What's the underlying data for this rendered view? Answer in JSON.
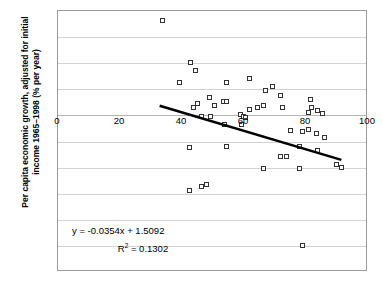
{
  "chart_data": {
    "type": "scatter",
    "title": "",
    "xlabel": "",
    "ylabel": "Per capita economic growth, adjusted for initial income 1965–1998 (% per year)",
    "ylabel_line1": "Per capita economic growth, adjusted for initial",
    "ylabel_line2": "income 1965–1998 (% per year)",
    "xlim": [
      0,
      100
    ],
    "ylim": [
      -6,
      4
    ],
    "xticks": [
      0,
      20,
      40,
      60,
      80,
      100
    ],
    "yticks": [
      4,
      3,
      2,
      1,
      0,
      -1,
      -2,
      -3,
      -4,
      -5,
      -6
    ],
    "xtick_labels": [
      "0",
      "20",
      "40",
      "60",
      "80",
      "100"
    ],
    "ytick_labels": [
      "4",
      "3",
      "2",
      "1",
      "0",
      "-1",
      "-2",
      "-3",
      "-4",
      "-5",
      "-6"
    ],
    "grid": "horizontal",
    "legend": "none",
    "marker": "open-square",
    "marker_color": "#333333",
    "trendline": {
      "equation": "y = -0.0354x + 1.5092",
      "r2_label": "R",
      "r2_exponent": "2",
      "r2_value": "= 0.1302",
      "slope": -0.0354,
      "intercept": 1.5092,
      "r_squared": 0.1302,
      "x_start": 33,
      "x_end": 92,
      "color": "#000000"
    },
    "points": [
      [
        34.0,
        3.6
      ],
      [
        43.0,
        2.0
      ],
      [
        44.5,
        1.7
      ],
      [
        39.5,
        1.25
      ],
      [
        54.5,
        1.25
      ],
      [
        62.0,
        1.4
      ],
      [
        67.0,
        0.95
      ],
      [
        69.5,
        1.1
      ],
      [
        72.0,
        0.75
      ],
      [
        49.0,
        0.65
      ],
      [
        45.0,
        0.45
      ],
      [
        53.5,
        0.5
      ],
      [
        54.5,
        0.5
      ],
      [
        50.5,
        0.35
      ],
      [
        44.0,
        0.3
      ],
      [
        64.5,
        0.3
      ],
      [
        66.5,
        0.35
      ],
      [
        62.0,
        0.2
      ],
      [
        72.5,
        0.3
      ],
      [
        81.5,
        0.6
      ],
      [
        82.0,
        0.3
      ],
      [
        81.0,
        0.1
      ],
      [
        84.0,
        0.15
      ],
      [
        85.5,
        0.05
      ],
      [
        46.5,
        -0.05
      ],
      [
        49.5,
        -0.05
      ],
      [
        59.0,
        0.0
      ],
      [
        60.0,
        -0.05
      ],
      [
        60.5,
        -0.1
      ],
      [
        54.0,
        -0.35
      ],
      [
        59.5,
        -0.35
      ],
      [
        75.0,
        -0.6
      ],
      [
        79.0,
        -0.65
      ],
      [
        81.0,
        -0.55
      ],
      [
        83.5,
        -0.7
      ],
      [
        86.0,
        -0.85
      ],
      [
        42.5,
        -1.25
      ],
      [
        54.5,
        -1.2
      ],
      [
        78.0,
        -1.2
      ],
      [
        84.0,
        -1.35
      ],
      [
        72.0,
        -1.6
      ],
      [
        74.0,
        -1.6
      ],
      [
        90.0,
        -1.9
      ],
      [
        91.5,
        -2.0
      ],
      [
        66.5,
        -2.05
      ],
      [
        78.0,
        -2.05
      ],
      [
        42.5,
        -2.9
      ],
      [
        46.5,
        -2.75
      ],
      [
        48.0,
        -2.65
      ],
      [
        79.0,
        -5.0
      ]
    ]
  }
}
